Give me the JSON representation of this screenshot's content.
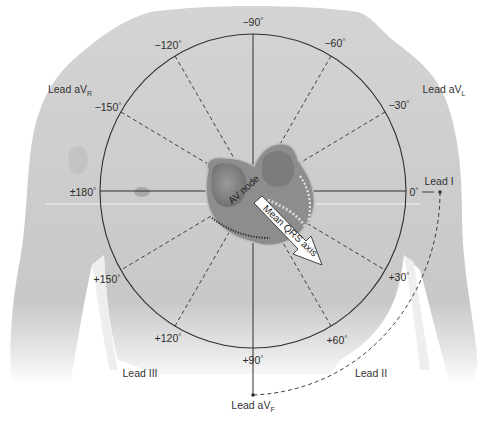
{
  "figure": {
    "circle": {
      "cx": 253,
      "cy": 191,
      "rx": 153,
      "ry": 157
    },
    "colors": {
      "background": "#ffffff",
      "torso": "#c9c9c9",
      "torso_shadow": "#b8b8b8",
      "line": "#2f2f2f",
      "arrow_fill": "#ffffff",
      "heart_dark": "#6f6f6f",
      "heart_light": "#a3a3a3"
    }
  },
  "angles": [
    {
      "value": "−90",
      "deg": -90,
      "x": 253,
      "y": 22
    },
    {
      "value": "−60",
      "deg": -60,
      "x": 335,
      "y": 43
    },
    {
      "value": "−30",
      "deg": -30,
      "x": 399,
      "y": 105
    },
    {
      "value": "0",
      "deg": 0,
      "x": 414,
      "y": 192
    },
    {
      "value": "+30",
      "deg": 30,
      "x": 399,
      "y": 277
    },
    {
      "value": "+60",
      "deg": 60,
      "x": 337,
      "y": 340
    },
    {
      "value": "+90",
      "deg": 90,
      "x": 253,
      "y": 360
    },
    {
      "value": "+120",
      "deg": 120,
      "x": 168,
      "y": 338
    },
    {
      "value": "+150",
      "deg": 150,
      "x": 107,
      "y": 279
    },
    {
      "value": "±180",
      "deg": 180,
      "x": 83,
      "y": 192
    },
    {
      "value": "−150",
      "deg": -150,
      "x": 108,
      "y": 107
    },
    {
      "value": "−120",
      "deg": -120,
      "x": 168,
      "y": 45
    }
  ],
  "leads": {
    "avr": {
      "name": "Lead aV",
      "sub": "R",
      "x": 70,
      "y": 90
    },
    "avl": {
      "name": "Lead aV",
      "sub": "L",
      "x": 444,
      "y": 90
    },
    "lead1": {
      "name": "Lead I",
      "x": 439,
      "y": 181
    },
    "lead3": {
      "name": "Lead III",
      "x": 140,
      "y": 373
    },
    "lead2": {
      "name": "Lead II",
      "x": 371,
      "y": 373
    },
    "avf": {
      "name": "Lead aV",
      "sub": "F",
      "x": 253,
      "y": 406
    }
  },
  "heart": {
    "av_node_label": "AV node",
    "axis_label": "Mean QRS axis",
    "axis_degrees": 42
  }
}
